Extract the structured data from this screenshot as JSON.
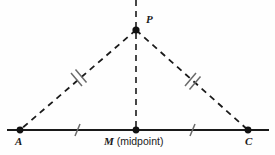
{
  "figure": {
    "background_color": "#fefefe",
    "stroke_color": "#1a1a1a",
    "tick_color": "#555555"
  },
  "labels": {
    "apex": "P",
    "left_vertex": "A",
    "right_vertex": "C",
    "midpoint_letter": "M",
    "midpoint_note": " (midpoint)"
  },
  "geometry": {
    "points": {
      "P": {
        "x": 136,
        "y": 30
      },
      "A": {
        "x": 20,
        "y": 130
      },
      "M": {
        "x": 136,
        "y": 130
      },
      "C": {
        "x": 248,
        "y": 130
      }
    },
    "baseline": {
      "x1": 7,
      "y1": 130,
      "x2": 269,
      "y2": 130
    },
    "altitude": {
      "x1": 136,
      "y1": 0,
      "x2": 136,
      "y2": 130
    }
  },
  "congruence_marks": {
    "leg_ticks": 2,
    "base_ticks": 1,
    "leg_tick_note": "double tick on PA and PC",
    "base_tick_note": "single tick on AM and MC"
  }
}
